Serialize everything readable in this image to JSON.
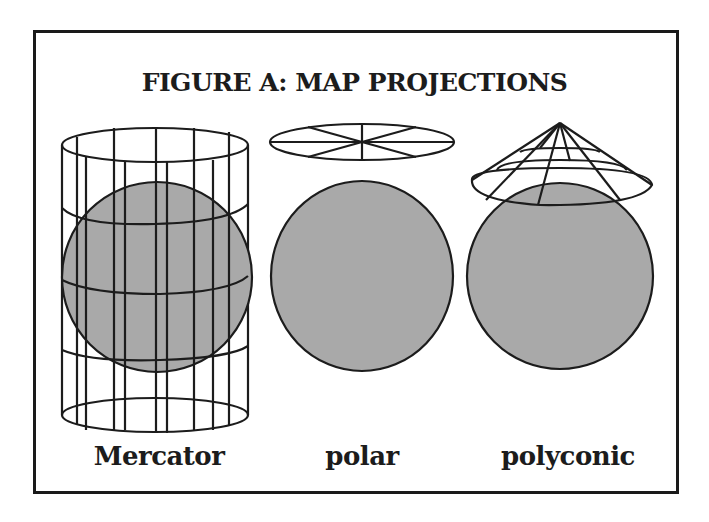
{
  "figure": {
    "title": "FIGURE A: MAP PROJECTIONS",
    "colors": {
      "border": "#1a1a1a",
      "globe_fill": "#a9a9a9",
      "line": "#1c1c1c",
      "background": "#ffffff"
    },
    "projections": [
      {
        "id": "mercator",
        "label": "Mercator",
        "surface": "cylinder"
      },
      {
        "id": "polar",
        "label": "polar",
        "surface": "flat disc"
      },
      {
        "id": "polyconic",
        "label": "polyconic",
        "surface": "cone"
      }
    ]
  }
}
